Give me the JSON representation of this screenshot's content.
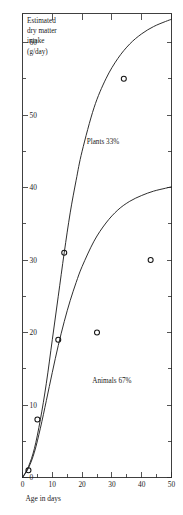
{
  "figure": {
    "background_color": "#ffffff",
    "ink_color": "#1a1a1a",
    "curve_color": "#232323",
    "marker_color": "#141414"
  },
  "chart_data": {
    "type": "line",
    "title": "",
    "subtitle": "",
    "xlabel": "Age in days",
    "ylabel": "Estimated dry matter intake (g/day)",
    "ylabel_lines": "Estimated\ndry matter\nintake\n(g/day)",
    "xlim": [
      0,
      50
    ],
    "ylim": [
      0,
      64
    ],
    "grid": false,
    "legend_position": "inline-annotations",
    "x_ticks": [
      0,
      10,
      20,
      30,
      40,
      50
    ],
    "x_tick_labels": [
      "0",
      "10",
      "20",
      "30",
      "40",
      "50"
    ],
    "x_minor_ticks": [
      5,
      15,
      25,
      35,
      45
    ],
    "y_ticks": [
      0,
      10,
      20,
      30,
      40,
      50,
      60
    ],
    "y_tick_labels": [
      "0",
      "10",
      "20",
      "30",
      "40",
      "50",
      "60"
    ],
    "y_minor_ticks": [
      5,
      15,
      25,
      35,
      45,
      55
    ],
    "annotations": [
      {
        "text": "Plants 33%",
        "x": 27,
        "y": 46
      },
      {
        "text": "Animals 67%",
        "x": 30,
        "y": 13
      }
    ],
    "series": [
      {
        "name": "Plants 33%",
        "style": "curve",
        "x": [
          0,
          2,
          4,
          6,
          8,
          10,
          12,
          14,
          16,
          18,
          20,
          24,
          28,
          32,
          36,
          40,
          44,
          48,
          50
        ],
        "values": [
          0,
          1.5,
          4,
          8,
          13,
          19,
          25,
          31,
          36.5,
          41,
          45,
          51,
          55,
          57.8,
          59.8,
          61.2,
          62.2,
          62.9,
          63.2
        ]
      },
      {
        "name": "Animals 67%",
        "style": "curve",
        "x": [
          0,
          2,
          4,
          6,
          8,
          10,
          12,
          14,
          16,
          18,
          20,
          24,
          28,
          32,
          36,
          40,
          44,
          48,
          50
        ],
        "values": [
          0,
          1.3,
          3.5,
          6.8,
          10.6,
          14.5,
          18.2,
          21.5,
          24.4,
          26.9,
          29.1,
          32.6,
          35.1,
          36.9,
          38.1,
          38.9,
          39.5,
          39.9,
          40.1
        ]
      },
      {
        "name": "Observed intake",
        "style": "scatter-open-circles",
        "points": [
          {
            "x": 2,
            "y": 1
          },
          {
            "x": 5,
            "y": 8
          },
          {
            "x": 12,
            "y": 19
          },
          {
            "x": 14,
            "y": 31
          },
          {
            "x": 25,
            "y": 20
          },
          {
            "x": 34,
            "y": 55
          },
          {
            "x": 43,
            "y": 30
          }
        ]
      }
    ]
  }
}
